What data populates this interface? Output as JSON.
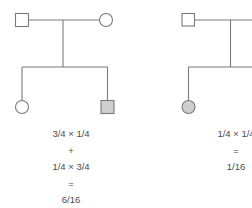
{
  "pedigrees": [
    {
      "id": "left",
      "parents": {
        "father": {
          "shape": "square",
          "affected": false
        },
        "mother": {
          "shape": "circle",
          "affected": false
        }
      },
      "children": [
        {
          "shape": "circle",
          "affected": false
        },
        {
          "shape": "square",
          "affected": true
        }
      ],
      "calculation": [
        "3/4 × 1/4",
        "+",
        "1/4 × 3/4",
        "=",
        "6/16"
      ]
    },
    {
      "id": "right",
      "parents": {
        "father": {
          "shape": "square",
          "affected": false
        }
      },
      "children": [
        {
          "shape": "circle",
          "affected": true
        }
      ],
      "calculation": [
        "1/4 × 1/4",
        "=",
        "1/16"
      ]
    }
  ],
  "colors": {
    "line": "#7a7a7a",
    "affected_fill": "#cfcfcf",
    "text": "#4a4a4a"
  }
}
